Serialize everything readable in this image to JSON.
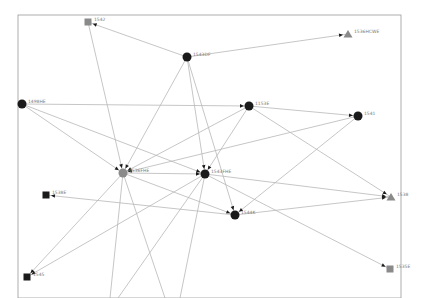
{
  "frame": {
    "x": 18,
    "y": 15,
    "width": 383,
    "height": 283,
    "stroke": "#9a9a9a"
  },
  "colors": {
    "edge": "#b8b8b8",
    "arrow": "#1a1a1a",
    "node_dark": "#1a1a1a",
    "node_gray": "#8a8a8a"
  },
  "nodes": [
    {
      "id": "n1",
      "label": "1542",
      "x": 88,
      "y": 22,
      "shape": "square",
      "color": "#8a8a8a"
    },
    {
      "id": "n2",
      "label": "1543DF",
      "x": 187,
      "y": 57,
      "shape": "cluster",
      "color": "#1a1a1a"
    },
    {
      "id": "n3",
      "label": "1536HCWE",
      "x": 348,
      "y": 34,
      "shape": "triangle",
      "color": "#8a8a8a"
    },
    {
      "id": "n4",
      "label": "1498HE",
      "x": 22,
      "y": 104,
      "shape": "cluster",
      "color": "#1a1a1a"
    },
    {
      "id": "n5",
      "label": "1153E",
      "x": 249,
      "y": 106,
      "shape": "cluster",
      "color": "#1a1a1a"
    },
    {
      "id": "n6",
      "label": "1541",
      "x": 358,
      "y": 116,
      "shape": "cluster",
      "color": "#1a1a1a"
    },
    {
      "id": "n7",
      "label": "1536FHE",
      "x": 123,
      "y": 173,
      "shape": "cluster",
      "color": "#8a8a8a"
    },
    {
      "id": "n8",
      "label": "1543FHE",
      "x": 205,
      "y": 174,
      "shape": "cluster",
      "color": "#1a1a1a"
    },
    {
      "id": "n9",
      "label": "1538E",
      "x": 46,
      "y": 195,
      "shape": "square",
      "color": "#1a1a1a"
    },
    {
      "id": "n10",
      "label": "1544K",
      "x": 235,
      "y": 215,
      "shape": "cluster",
      "color": "#1a1a1a"
    },
    {
      "id": "n11",
      "label": "1538",
      "x": 391,
      "y": 197,
      "shape": "triangle",
      "color": "#8a8a8a"
    },
    {
      "id": "n12",
      "label": "1545",
      "x": 27,
      "y": 277,
      "shape": "square",
      "color": "#1a1a1a"
    },
    {
      "id": "n13",
      "label": "1535E",
      "x": 390,
      "y": 269,
      "shape": "square",
      "color": "#8a8a8a"
    }
  ],
  "edges": [
    {
      "from": "n2",
      "to": "n1"
    },
    {
      "from": "n2",
      "to": "n3"
    },
    {
      "from": "n1",
      "to": "n7"
    },
    {
      "from": "n2",
      "to": "n7"
    },
    {
      "from": "n2",
      "to": "n8"
    },
    {
      "from": "n2",
      "to": "n10"
    },
    {
      "from": "n4",
      "to": "n5"
    },
    {
      "from": "n4",
      "to": "n7"
    },
    {
      "from": "n4",
      "to": "n8"
    },
    {
      "from": "n5",
      "to": "n6"
    },
    {
      "from": "n5",
      "to": "n7"
    },
    {
      "from": "n5",
      "to": "n8"
    },
    {
      "from": "n5",
      "to": "n11"
    },
    {
      "from": "n6",
      "to": "n7"
    },
    {
      "from": "n6",
      "to": "n10"
    },
    {
      "from": "n7",
      "to": "n8"
    },
    {
      "from": "n7",
      "to": "n10"
    },
    {
      "from": "n7",
      "to": "n12"
    },
    {
      "from": "n8",
      "to": "n12"
    },
    {
      "from": "n8",
      "to": "n11"
    },
    {
      "from": "n8",
      "to": "n13"
    },
    {
      "from": "n10",
      "to": "n9"
    },
    {
      "from": "n10",
      "to": "n11"
    },
    {
      "from": "n7",
      "to": "n7b"
    },
    {
      "from": "n7",
      "to": "n7c"
    },
    {
      "from": "n8",
      "to": "n8b"
    },
    {
      "from": "n8",
      "to": "n8c"
    }
  ],
  "offscreen": {
    "n7b": {
      "x": 110,
      "y": 298
    },
    "n7c": {
      "x": 165,
      "y": 298
    },
    "n8b": {
      "x": 118,
      "y": 298
    },
    "n8c": {
      "x": 180,
      "y": 298
    }
  }
}
